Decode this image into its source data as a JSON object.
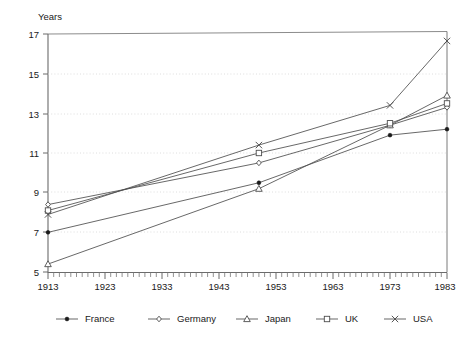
{
  "chart_data": {
    "type": "line",
    "title": "",
    "ylabel": "Years",
    "xlabel": "",
    "ylim": [
      5,
      17
    ],
    "xlim": [
      1913,
      1983
    ],
    "grid": true,
    "legend_position": "bottom",
    "ytick_labels": [
      "17",
      "15",
      "13",
      "11",
      "9",
      "7",
      "5"
    ],
    "ytick_values": [
      17,
      15,
      13,
      11,
      9,
      7,
      5
    ],
    "xtick_labels": [
      "1913",
      "1923",
      "1933",
      "1943",
      "1953",
      "1963",
      "1973",
      "1983"
    ],
    "xtick_values": [
      1913,
      1923,
      1933,
      1943,
      1953,
      1963,
      1973,
      1983
    ],
    "x": [
      1913,
      1950,
      1973,
      1983
    ],
    "series": [
      {
        "name": "France",
        "marker": "filled-circle",
        "values": [
          7.0,
          9.5,
          11.9,
          12.2
        ]
      },
      {
        "name": "Germany",
        "marker": "diamond",
        "values": [
          8.4,
          10.5,
          12.4,
          13.3
        ]
      },
      {
        "name": "Japan",
        "marker": "triangle",
        "values": [
          5.4,
          9.2,
          12.4,
          13.9
        ]
      },
      {
        "name": "UK",
        "marker": "square",
        "values": [
          8.1,
          11.0,
          12.5,
          13.5
        ]
      },
      {
        "name": "USA",
        "marker": "cross",
        "values": [
          7.9,
          11.4,
          13.4,
          16.65
        ]
      }
    ]
  },
  "axis": {
    "y_title": "Years",
    "y_ticks": [
      "17",
      "15",
      "13",
      "11",
      "9",
      "7",
      "5"
    ],
    "x_ticks": [
      "1913",
      "1923",
      "1933",
      "1943",
      "1953",
      "1963",
      "1973",
      "1983"
    ]
  },
  "legend": {
    "items": [
      {
        "label": "France",
        "marker": "filled-circle-marker"
      },
      {
        "label": "Germany",
        "marker": "diamond-marker"
      },
      {
        "label": "Japan",
        "marker": "triangle-marker"
      },
      {
        "label": "UK",
        "marker": "square-marker"
      },
      {
        "label": "USA",
        "marker": "cross-marker"
      }
    ]
  },
  "colors": {
    "line": "#4d4d4d",
    "axis": "#595959",
    "grid": "#cfcfcf",
    "text": "#1a1a1a",
    "marker_fill": "#ffffff"
  }
}
